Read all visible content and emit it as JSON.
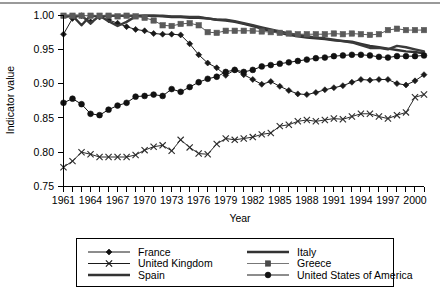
{
  "chart_data": {
    "type": "line",
    "title": "",
    "xlabel": "Year",
    "ylabel": "Indicator value",
    "xlim": [
      1961,
      2001
    ],
    "ylim": [
      0.75,
      1.0
    ],
    "yticks": [
      "0.75",
      "0.80",
      "0.85",
      "0.90",
      "0.95",
      "1.00"
    ],
    "ytick_values": [
      0.75,
      0.8,
      0.85,
      0.9,
      0.95,
      1.0
    ],
    "xticks_labeled": [
      "1961",
      "1964",
      "1967",
      "1970",
      "1973",
      "1976",
      "1979",
      "1982",
      "1985",
      "1988",
      "1991",
      "1994",
      "1997",
      "2000"
    ],
    "xtick_step_minor": 1,
    "grid": false,
    "legend_position": "below-plot",
    "x": [
      1961,
      1962,
      1963,
      1964,
      1965,
      1966,
      1967,
      1968,
      1969,
      1970,
      1971,
      1972,
      1973,
      1974,
      1975,
      1976,
      1977,
      1978,
      1979,
      1980,
      1981,
      1982,
      1983,
      1984,
      1985,
      1986,
      1987,
      1988,
      1989,
      1990,
      1991,
      1992,
      1993,
      1994,
      1995,
      1996,
      1997,
      1998,
      1999,
      2000,
      2001
    ],
    "series": [
      {
        "name": "France",
        "marker": "diamond",
        "line_style": "thin",
        "color": "#1a1a1a",
        "values": [
          0.972,
          0.995,
          0.999,
          0.99,
          0.997,
          0.993,
          0.988,
          0.983,
          0.979,
          0.977,
          0.973,
          0.972,
          0.972,
          0.971,
          0.958,
          0.942,
          0.93,
          0.923,
          0.912,
          0.92,
          0.913,
          0.906,
          0.899,
          0.903,
          0.896,
          0.89,
          0.885,
          0.884,
          0.887,
          0.891,
          0.894,
          0.897,
          0.902,
          0.906,
          0.905,
          0.906,
          0.906,
          0.9,
          0.898,
          0.904,
          0.913
        ]
      },
      {
        "name": "United Kingdom",
        "marker": "cross",
        "line_style": "thin",
        "color": "#2b2b2b",
        "values": [
          0.778,
          0.787,
          0.8,
          0.797,
          0.793,
          0.793,
          0.793,
          0.793,
          0.796,
          0.803,
          0.808,
          0.81,
          0.802,
          0.818,
          0.807,
          0.798,
          0.797,
          0.812,
          0.82,
          0.818,
          0.82,
          0.822,
          0.826,
          0.828,
          0.838,
          0.84,
          0.845,
          0.847,
          0.845,
          0.847,
          0.849,
          0.848,
          0.852,
          0.856,
          0.856,
          0.852,
          0.849,
          0.854,
          0.858,
          0.88,
          0.884
        ]
      },
      {
        "name": "Spain",
        "marker": "none",
        "line_style": "thick",
        "color": "#333333",
        "values": [
          0.997,
          0.999,
          0.985,
          0.999,
          0.998,
          0.999,
          0.999,
          0.999,
          0.999,
          0.999,
          0.999,
          0.998,
          0.997,
          0.997,
          0.996,
          0.996,
          0.995,
          0.993,
          0.992,
          0.99,
          0.987,
          0.984,
          0.98,
          0.977,
          0.974,
          0.971,
          0.969,
          0.967,
          0.966,
          0.965,
          0.963,
          0.962,
          0.961,
          0.958,
          0.955,
          0.953,
          0.951,
          0.949,
          0.947,
          0.946,
          0.944
        ]
      },
      {
        "name": "Italy",
        "marker": "none",
        "line_style": "thick",
        "color": "#3a3a3a",
        "values": [
          0.999,
          0.999,
          0.999,
          0.988,
          0.999,
          0.991,
          0.984,
          0.99,
          0.998,
          0.999,
          0.999,
          0.999,
          0.998,
          0.998,
          0.997,
          0.997,
          0.995,
          0.993,
          0.993,
          0.991,
          0.988,
          0.985,
          0.982,
          0.979,
          0.976,
          0.973,
          0.971,
          0.969,
          0.967,
          0.966,
          0.964,
          0.962,
          0.96,
          0.956,
          0.952,
          0.952,
          0.95,
          0.955,
          0.953,
          0.95,
          0.947
        ]
      },
      {
        "name": "Greece",
        "marker": "square",
        "line_style": "thin-gray",
        "color": "#5a5a5a",
        "values": [
          0.999,
          0.999,
          0.999,
          0.999,
          0.999,
          0.999,
          0.998,
          0.999,
          0.998,
          0.996,
          0.992,
          0.985,
          0.984,
          0.987,
          0.988,
          0.985,
          0.975,
          0.974,
          0.977,
          0.977,
          0.977,
          0.977,
          0.976,
          0.975,
          0.974,
          0.973,
          0.972,
          0.972,
          0.972,
          0.972,
          0.973,
          0.972,
          0.973,
          0.972,
          0.971,
          0.972,
          0.978,
          0.98,
          0.978,
          0.978,
          0.978
        ]
      },
      {
        "name": "United States of America",
        "marker": "circle",
        "line_style": "thin",
        "color": "#111111",
        "values": [
          0.872,
          0.878,
          0.87,
          0.856,
          0.854,
          0.862,
          0.868,
          0.872,
          0.881,
          0.882,
          0.884,
          0.882,
          0.892,
          0.888,
          0.895,
          0.902,
          0.907,
          0.91,
          0.917,
          0.92,
          0.917,
          0.92,
          0.925,
          0.927,
          0.929,
          0.931,
          0.933,
          0.935,
          0.937,
          0.938,
          0.94,
          0.941,
          0.942,
          0.942,
          0.941,
          0.939,
          0.938,
          0.94,
          0.94,
          0.94,
          0.941
        ]
      }
    ],
    "legend": [
      {
        "label": "France",
        "marker": "diamond",
        "line_style": "thin"
      },
      {
        "label": "Italy",
        "marker": "none",
        "line_style": "thick"
      },
      {
        "label": "United Kingdom",
        "marker": "cross",
        "line_style": "thin"
      },
      {
        "label": "Greece",
        "marker": "square",
        "line_style": "thin-gray"
      },
      {
        "label": "Spain",
        "marker": "none",
        "line_style": "thick"
      },
      {
        "label": "United States of America",
        "marker": "circle",
        "line_style": "thin"
      }
    ]
  }
}
